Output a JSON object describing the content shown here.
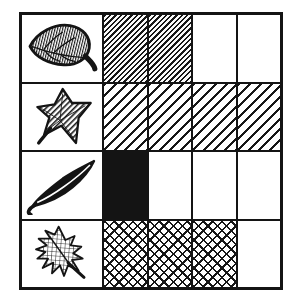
{
  "chart_data": {
    "type": "pictograph",
    "title": "",
    "columns": 4,
    "legend_position": "left-column",
    "rows": [
      {
        "label": "ovate-leaf",
        "count": 2,
        "pattern": "dense-diagonal-hatch"
      },
      {
        "label": "maple-leaf",
        "count": 4,
        "pattern": "diagonal-hatch"
      },
      {
        "label": "willow-leaf",
        "count": 1,
        "pattern": "solid"
      },
      {
        "label": "oak-leaf",
        "count": 3,
        "pattern": "crosshatch"
      }
    ]
  },
  "colors": {
    "ink": "#141414",
    "background": "#ffffff"
  }
}
